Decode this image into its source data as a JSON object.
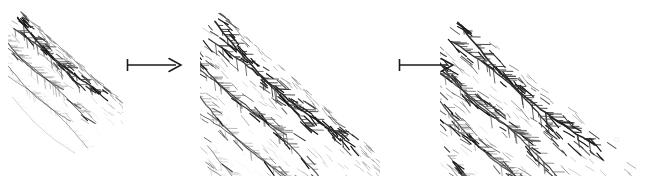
{
  "figure": {
    "kind": "hand-drawn-sketch-sequence",
    "background_color": "#ffffff",
    "width": 661,
    "height": 176,
    "ink_color": "#1a1a1a",
    "mid_ink_color": "#555555",
    "light_ink_color": "#9a9a9a",
    "faint_ink_color": "#c8c8c8"
  },
  "panels": [
    {
      "id": "stage-1",
      "label": "stage-1-base-strokes",
      "caption": "",
      "x": 8,
      "width": 115,
      "stage_index": 1,
      "description": "Sparse base: long tapered contour strokes with short feathered hatching along the upper-left edges only",
      "hatch_density": 1,
      "hatch_extent": 0.42,
      "detail_level": "low"
    },
    {
      "id": "stage-2",
      "label": "stage-2-added-hatching",
      "caption": "",
      "x": 200,
      "width": 180,
      "stage_index": 2,
      "description": "Hatching extended: the same contour strokes now carry dense short hatch marks that spread down and to the right, fading out",
      "hatch_density": 2,
      "hatch_extent": 0.78,
      "detail_level": "medium"
    },
    {
      "id": "stage-3",
      "label": "stage-3-full-texture",
      "caption": "",
      "x": 440,
      "width": 215,
      "stage_index": 3,
      "description": "Fully developed: hatching fills the entire field, darkest at the upper-left contour cluster and fading into sparse strokes at lower right",
      "hatch_density": 3,
      "hatch_extent": 1.0,
      "detail_level": "high"
    }
  ],
  "arrows": [
    {
      "id": "arrow-1",
      "glyph_name": "mapsto-arrow",
      "symbol": "↦",
      "label": "",
      "x": 126,
      "y": 65,
      "length": 54,
      "has_tail_bar": true
    },
    {
      "id": "arrow-2",
      "glyph_name": "mapsto-arrow",
      "symbol": "↦",
      "label": "",
      "x": 398,
      "y": 65,
      "length": 54,
      "has_tail_bar": true
    }
  ],
  "artifacts": [
    {
      "id": "watermark-smudge",
      "name": "faint-scan-smudge",
      "text": "○",
      "x": 613,
      "y": 133
    }
  ]
}
